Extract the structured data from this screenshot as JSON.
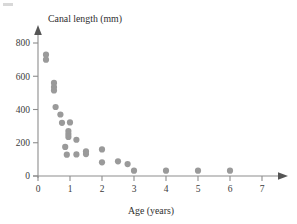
{
  "chart_data": {
    "type": "scatter",
    "title": "",
    "xlabel": "Age (years)",
    "ylabel": "Canal length (mm)",
    "xlim": [
      0,
      7.4
    ],
    "ylim": [
      0,
      860
    ],
    "xticks": [
      0,
      1,
      2,
      3,
      4,
      5,
      6,
      7
    ],
    "xticklabels": [
      "0",
      "1",
      "2",
      "3",
      "4",
      "5",
      "6",
      "7"
    ],
    "yticks": [
      0,
      200,
      400,
      600,
      800
    ],
    "yticklabels": [
      "0",
      "200",
      "400",
      "600",
      "800"
    ],
    "grid": false,
    "legend": null,
    "marker_color": "#9a9a9a",
    "marker_size": 3.1,
    "axis_color": "#8d8d8d",
    "points": [
      {
        "x": 0.25,
        "y": 730
      },
      {
        "x": 0.25,
        "y": 700
      },
      {
        "x": 0.5,
        "y": 560
      },
      {
        "x": 0.5,
        "y": 535
      },
      {
        "x": 0.5,
        "y": 515
      },
      {
        "x": 0.55,
        "y": 415
      },
      {
        "x": 0.7,
        "y": 370
      },
      {
        "x": 0.75,
        "y": 320
      },
      {
        "x": 1.0,
        "y": 322
      },
      {
        "x": 0.95,
        "y": 270
      },
      {
        "x": 0.95,
        "y": 252
      },
      {
        "x": 0.95,
        "y": 235
      },
      {
        "x": 1.2,
        "y": 218
      },
      {
        "x": 0.85,
        "y": 175
      },
      {
        "x": 0.9,
        "y": 128
      },
      {
        "x": 1.2,
        "y": 130
      },
      {
        "x": 1.5,
        "y": 148
      },
      {
        "x": 1.5,
        "y": 132
      },
      {
        "x": 2.0,
        "y": 160
      },
      {
        "x": 2.0,
        "y": 82
      },
      {
        "x": 2.5,
        "y": 88
      },
      {
        "x": 2.8,
        "y": 72
      },
      {
        "x": 3.0,
        "y": 32
      },
      {
        "x": 4.0,
        "y": 32
      },
      {
        "x": 5.0,
        "y": 32
      },
      {
        "x": 6.0,
        "y": 32
      }
    ]
  },
  "labels": {
    "y_axis_title": "Canal length (mm)",
    "x_axis_title": "Age (years)"
  }
}
